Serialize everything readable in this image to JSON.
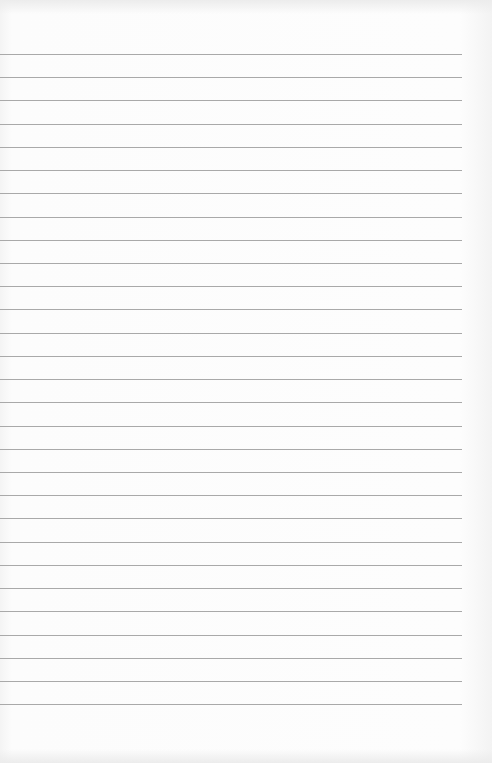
{
  "page": {
    "type": "blank lined paper",
    "background_color": "#fbfbfb",
    "rule_color": "#a9a9a9",
    "rule_count": 29,
    "first_rule_y": 54,
    "rule_spacing": 23.22,
    "rule_width": 462
  }
}
